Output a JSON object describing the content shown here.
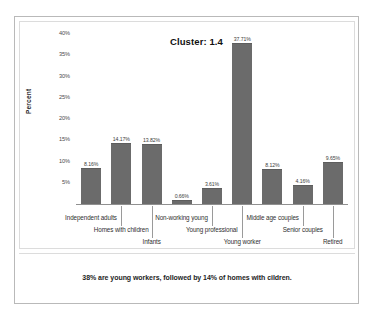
{
  "chart_data": {
    "type": "bar",
    "title": "Cluster: 1.4",
    "xlabel": "",
    "ylabel": "Percent",
    "ylim": [
      0,
      40
    ],
    "grid": false,
    "legend": "none",
    "categories": [
      "Independent adults",
      "Homes with children",
      "Infants",
      "Non-working young",
      "Young professional",
      "Young worker",
      "Middle age couples",
      "Senior couples",
      "Retired"
    ],
    "values": [
      8.16,
      14.17,
      13.82,
      0.66,
      3.61,
      37.71,
      8.12,
      4.16,
      9.65
    ],
    "data_labels": [
      "8.16%",
      "14.17%",
      "13.82%",
      "0.66%",
      "3.61%",
      "37.71%",
      "8.12%",
      "4.16%",
      "9.65%"
    ],
    "y_ticks": [
      "0%",
      "5%",
      "10%",
      "15%",
      "20%",
      "25%",
      "30%",
      "35%",
      "40%"
    ],
    "y_tick_values": [
      0,
      5,
      10,
      15,
      20,
      25,
      30,
      35,
      40
    ],
    "bar_color": "#6b6b6b",
    "annotation": "38% are young workers, followed by 14% of homes with cildren."
  },
  "footer": {
    "caption": "38% are young workers, followed by 14% of homes with cildren."
  }
}
